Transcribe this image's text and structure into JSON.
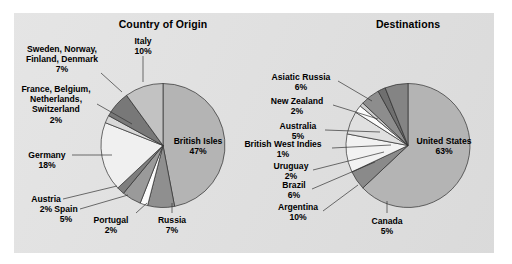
{
  "figure": {
    "background_color": "#ffffff",
    "panel_color": "#dcdcdc"
  },
  "chart_data": [
    {
      "type": "pie",
      "title": "Country of Origin",
      "position": "left",
      "units": "percent",
      "categories": [
        "British Isles",
        "Russia",
        "Portugal",
        "Spain",
        "Austria",
        "Germany",
        "France, Belgium, Netherlands, Switzerland",
        "Sweden, Norway, Finland, Denmark",
        "Italy"
      ],
      "values": [
        47,
        7,
        2,
        5,
        2,
        18,
        2,
        7,
        10
      ],
      "labels": [
        "British Isles 47%",
        "Russia 7%",
        "Portugal 2%",
        "Spain 5%",
        "Austria 2%",
        "Germany 18%",
        "France, Belgium, Netherlands, Switzerland 2%",
        "Sweden, Norway, Finland, Denmark 7%",
        "Italy 10%"
      ],
      "slice_colors": [
        "#b4b4b4",
        "#8f8f8f",
        "#fbfbfb",
        "#9a9a9a",
        "#7e7e7e",
        "#f0f0f0",
        "#d8d8d8",
        "#787878",
        "#c2c2c2"
      ],
      "legend": "none",
      "grid": false
    },
    {
      "type": "pie",
      "title": "Destinations",
      "position": "right",
      "units": "percent",
      "categories": [
        "United States",
        "Canada",
        "Argentina",
        "Brazil",
        "Uruguay",
        "British West Indies",
        "Australia",
        "New Zealand",
        "Asiatic Russia"
      ],
      "values": [
        63,
        5,
        10,
        6,
        2,
        1,
        5,
        2,
        6
      ],
      "labels": [
        "United States 63%",
        "Canada 5%",
        "Argentina 10%",
        "Brazil 6%",
        "Uruguay 2%",
        "British West Indies 1%",
        "Australia 5%",
        "New Zealand 2%",
        "Asiatic Russia 6%"
      ],
      "slice_colors": [
        "#b4b4b4",
        "#8a8a8a",
        "#f2f2f2",
        "#e0e0e0",
        "#fbfbfb",
        "#cfcfcf",
        "#8d8d8d",
        "#6f6f6f",
        "#848484"
      ],
      "legend": "none",
      "grid": false
    }
  ],
  "origin": {
    "title": "Country of Origin",
    "callouts": {
      "sweden": {
        "name": "Sweden, Norway,",
        "name2": "Finland, Denmark",
        "value": "7%"
      },
      "france": {
        "name": "France, Belgium,",
        "name2": "Netherlands,",
        "name3": "Switzerland",
        "value": "2%"
      },
      "germany": {
        "name": "Germany",
        "value": "18%"
      },
      "austria": {
        "name": "Austria",
        "value": "2%"
      },
      "spain": {
        "name": "Spain",
        "value": "5%"
      },
      "portugal": {
        "name": "Portugal",
        "value": "2%"
      },
      "russia": {
        "name": "Russia",
        "value": "7%"
      },
      "italy": {
        "name": "Italy",
        "value": "10%"
      },
      "british_isles": {
        "name": "British Isles",
        "value": "47%"
      }
    }
  },
  "destinations": {
    "title": "Destinations",
    "callouts": {
      "asiatic_russia": {
        "name": "Asiatic Russia",
        "value": "6%"
      },
      "new_zealand": {
        "name": "New Zealand",
        "value": "2%"
      },
      "australia": {
        "name": "Australia",
        "value": "5%"
      },
      "bwi": {
        "name": "British West Indies",
        "value": "1%"
      },
      "uruguay": {
        "name": "Uruguay",
        "value": "2%"
      },
      "brazil": {
        "name": "Brazil",
        "value": "6%"
      },
      "argentina": {
        "name": "Argentina",
        "value": "10%"
      },
      "canada": {
        "name": "Canada",
        "value": "5%"
      },
      "united_states": {
        "name": "United States",
        "value": "63%"
      }
    }
  }
}
